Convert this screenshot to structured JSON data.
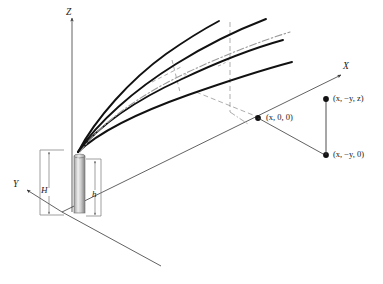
{
  "figure": {
    "background_color": "#ffffff",
    "line_color": "#3a3a3a",
    "ray_color": "#111111",
    "center_ray_color": "#8c8c8c",
    "rod_color_light": "#d8d8d8",
    "rod_color_dark": "#8f8f8f",
    "bracket_color": "#6f6f6f",
    "dash_color": "#7a7a7a"
  },
  "axes": [
    {
      "name": "z-axis",
      "label": "Z"
    },
    {
      "name": "x-axis",
      "label": "X"
    },
    {
      "name": "y-axis",
      "label": "Y"
    }
  ],
  "dimensions": [
    {
      "name": "total-height",
      "label": "H"
    },
    {
      "name": "rod-height",
      "label": "h"
    }
  ],
  "points": [
    {
      "name": "point-x00",
      "label": "(x, 0, 0)"
    },
    {
      "name": "point-xnyz",
      "label": "(x, −y, z)"
    },
    {
      "name": "point-xny0",
      "label": "(x, −y, 0)"
    }
  ],
  "labels": {
    "z": "Z",
    "x": "X",
    "y": "Y",
    "H": "H",
    "h": "h",
    "p_x00": "(x, 0, 0)",
    "p_xnyz": "(x, −y, z)",
    "p_xny0": "(x, −y, 0)"
  },
  "elements": {
    "rod": "vertical-antenna-rod",
    "rays": "radiated-ray-fan",
    "ray_count": 4,
    "center_line": "dash-dot-center-axis",
    "ground_line": "ground-plane-extension",
    "vertical_dashed": "vertical-reference-dashed-line"
  }
}
